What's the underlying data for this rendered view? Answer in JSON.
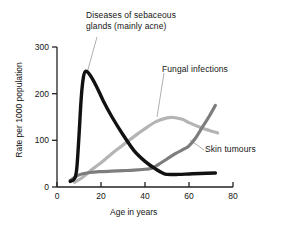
{
  "chart_data": {
    "type": "line",
    "title": "",
    "xlabel": "Age in years",
    "ylabel": "Rate per 1000 population",
    "xlim": [
      0,
      80
    ],
    "ylim": [
      0,
      300
    ],
    "xticks": [
      0,
      20,
      40,
      60,
      80
    ],
    "yticks": [
      0,
      100,
      200,
      300
    ],
    "grid": false,
    "legend_position": "inline-annotations",
    "series": [
      {
        "name": "Diseases of sebaceous glands (mainly acne)",
        "color": "#111111",
        "label_line1": "Diseases of sebaceous",
        "label_line2": "glands (mainly acne)",
        "points": [
          [
            6,
            12
          ],
          [
            8,
            18
          ],
          [
            9,
            40
          ],
          [
            10,
            110
          ],
          [
            11,
            190
          ],
          [
            12,
            235
          ],
          [
            13,
            248
          ],
          [
            15,
            240
          ],
          [
            18,
            215
          ],
          [
            21,
            185
          ],
          [
            25,
            150
          ],
          [
            30,
            112
          ],
          [
            35,
            78
          ],
          [
            40,
            55
          ],
          [
            45,
            38
          ],
          [
            48,
            30
          ],
          [
            50,
            27
          ],
          [
            55,
            27
          ],
          [
            60,
            28
          ],
          [
            65,
            29
          ],
          [
            72,
            30
          ]
        ]
      },
      {
        "name": "Fungal infections",
        "color": "#b4b4b4",
        "label_line1": "Fungal infections",
        "points": [
          [
            8,
            10
          ],
          [
            12,
            22
          ],
          [
            16,
            38
          ],
          [
            20,
            52
          ],
          [
            25,
            72
          ],
          [
            30,
            90
          ],
          [
            35,
            108
          ],
          [
            40,
            125
          ],
          [
            45,
            140
          ],
          [
            50,
            148
          ],
          [
            53,
            149
          ],
          [
            57,
            145
          ],
          [
            60,
            138
          ],
          [
            65,
            128
          ],
          [
            70,
            120
          ],
          [
            73,
            116
          ]
        ]
      },
      {
        "name": "Skin tumours",
        "color": "#7d7d7d",
        "label_line1": "Skin tumours",
        "points": [
          [
            6,
            14
          ],
          [
            10,
            26
          ],
          [
            15,
            31
          ],
          [
            20,
            33
          ],
          [
            25,
            34
          ],
          [
            30,
            35
          ],
          [
            35,
            36
          ],
          [
            40,
            38
          ],
          [
            43,
            40
          ],
          [
            46,
            48
          ],
          [
            50,
            60
          ],
          [
            54,
            72
          ],
          [
            58,
            82
          ],
          [
            60,
            88
          ],
          [
            63,
            105
          ],
          [
            66,
            128
          ],
          [
            69,
            150
          ],
          [
            72,
            175
          ]
        ]
      }
    ],
    "annotations": [
      {
        "text": "Diseases of sebaceous glands (mainly acne)",
        "points_to": [
          13,
          248
        ]
      },
      {
        "text": "Fungal infections",
        "points_to": [
          50,
          148
        ]
      },
      {
        "text": "Skin tumours",
        "points_to": [
          62,
          98
        ]
      }
    ]
  },
  "axis": {
    "x_tick_labels": [
      "0",
      "20",
      "40",
      "60",
      "80"
    ],
    "y_tick_labels": [
      "0",
      "100",
      "200",
      "300"
    ],
    "x_title": "Age in years",
    "y_title": "Rate per 1000 population"
  },
  "labels": {
    "acne_line1": "Diseases of sebaceous",
    "acne_line2": "glands (mainly acne)",
    "fungal": "Fungal infections",
    "tumours": "Skin tumours"
  },
  "colors": {
    "background": "#ffffff",
    "axis": "#222222",
    "acne": "#111111",
    "fungal": "#b4b4b4",
    "tumours": "#7d7d7d",
    "leader": "#9a9a9a"
  }
}
